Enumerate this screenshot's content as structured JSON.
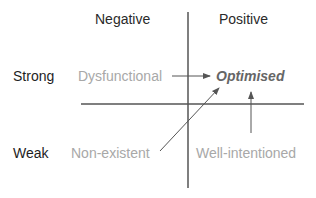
{
  "columns": {
    "negative": "Negative",
    "positive": "Positive"
  },
  "rows": {
    "strong": "Strong",
    "weak": "Weak"
  },
  "quadrants": {
    "strong_negative": "Dysfunctional",
    "strong_positive": "Optimised",
    "weak_negative": "Non-existent",
    "weak_positive": "Well-intentioned"
  },
  "colors": {
    "axis": "#555555",
    "arrow": "#555555",
    "quadrant_text": "#a8a8a8",
    "highlight_text": "#666666"
  },
  "arrows": [
    {
      "from": "Dysfunctional",
      "to": "Optimised"
    },
    {
      "from": "Non-existent",
      "to": "Optimised"
    },
    {
      "from": "Well-intentioned",
      "to": "Optimised"
    }
  ]
}
